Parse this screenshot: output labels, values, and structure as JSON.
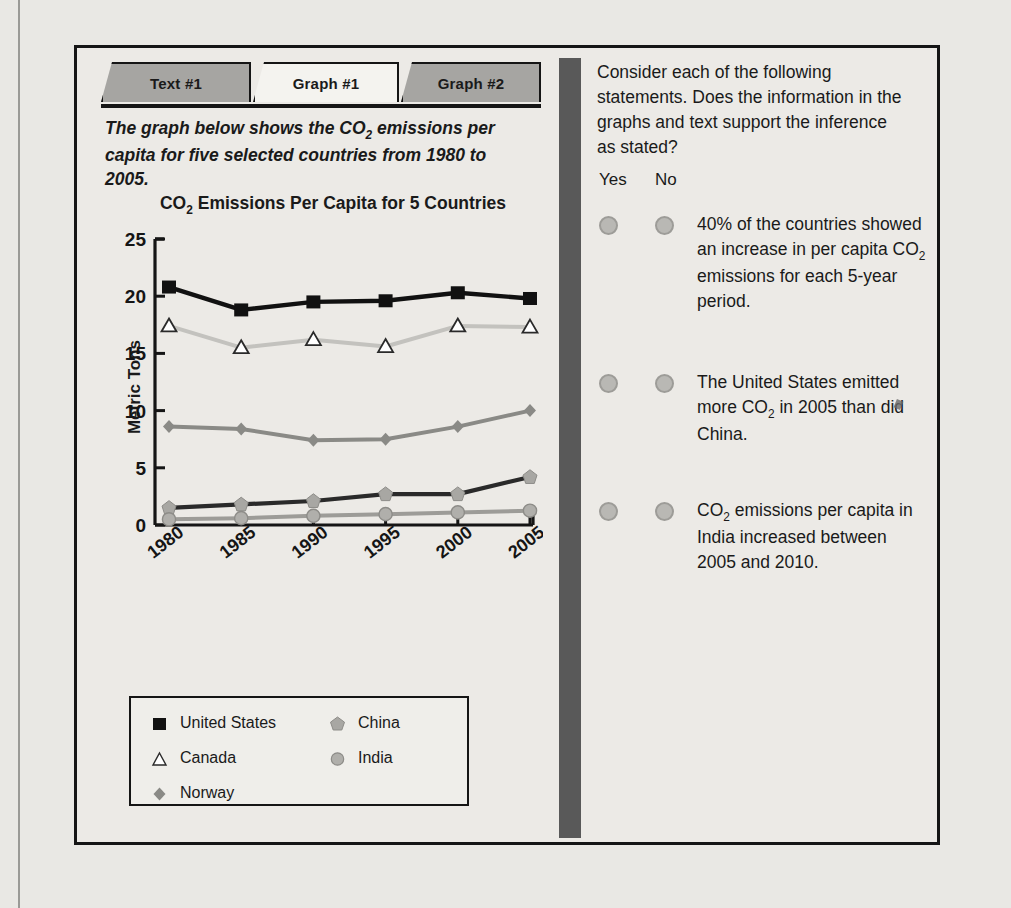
{
  "tabs": [
    {
      "label": "Text #1",
      "active": false
    },
    {
      "label": "Graph #1",
      "active": true
    },
    {
      "label": "Graph #2",
      "active": false
    }
  ],
  "prompt": {
    "line1_a": "The graph below shows the CO",
    "line1_sub": "2",
    "line1_b": " emissions per",
    "line2": "capita for five selected countries from 1980 to 2005."
  },
  "question": {
    "text": "Consider each of the following statements. Does the information in the graphs and text support the inference as stated?",
    "yes_label": "Yes",
    "no_label": "No"
  },
  "statements": [
    {
      "parts": [
        "40% of the countries showed an increase in per capita CO",
        "2",
        " emissions for each 5-year period."
      ],
      "yes_selected": false,
      "no_selected": false
    },
    {
      "parts": [
        "The United States emitted more CO",
        "2",
        " in 2005 than did China."
      ],
      "yes_selected": false,
      "no_selected": false
    },
    {
      "parts": [
        "CO",
        "2",
        " emissions per capita in India increased between 2005 and 2010."
      ],
      "yes_selected": false,
      "no_selected": false
    }
  ],
  "chart_data": {
    "type": "line",
    "title_a": "CO",
    "title_sub": "2",
    "title_b": " Emissions Per Capita for 5 Countries",
    "title": "CO2 Emissions Per Capita for 5 Countries",
    "xlabel": "",
    "ylabel": "Metric Tons",
    "categories": [
      "1980",
      "1985",
      "1990",
      "1995",
      "2000",
      "2005"
    ],
    "yticks": [
      0,
      5,
      10,
      15,
      20,
      25
    ],
    "ylim": [
      0,
      25
    ],
    "grid": false,
    "legend_position": "below-plot",
    "series": [
      {
        "name": "United States",
        "marker": "square",
        "color": "#111111",
        "line_color": "#111111",
        "values": [
          20.8,
          18.8,
          19.5,
          19.6,
          20.3,
          19.8
        ]
      },
      {
        "name": "Canada",
        "marker": "triangle",
        "color": "#ffffff",
        "line_color": "#c3c2be",
        "values": [
          17.4,
          15.5,
          16.2,
          15.6,
          17.4,
          17.3
        ]
      },
      {
        "name": "Norway",
        "marker": "diamond",
        "color": "#8a8a86",
        "line_color": "#8a8a86",
        "values": [
          8.6,
          8.4,
          7.4,
          7.5,
          8.6,
          10.0
        ]
      },
      {
        "name": "China",
        "marker": "pentagon",
        "color": "#a8a7a3",
        "line_color": "#2a2a2a",
        "values": [
          1.5,
          1.8,
          2.1,
          2.7,
          2.7,
          4.2
        ]
      },
      {
        "name": "India",
        "marker": "circle",
        "color": "#b0afab",
        "line_color": "#9d9c98",
        "values": [
          0.5,
          0.6,
          0.8,
          0.95,
          1.1,
          1.25
        ]
      }
    ]
  },
  "legend": [
    {
      "name": "United States",
      "marker": "square"
    },
    {
      "name": "China",
      "marker": "pentagon"
    },
    {
      "name": "Canada",
      "marker": "triangle"
    },
    {
      "name": "India",
      "marker": "circle"
    },
    {
      "name": "Norway",
      "marker": "diamond"
    }
  ],
  "colors": {
    "frame": "#151515",
    "page_bg": "#e9e8e4",
    "panel_bg": "#eceae6",
    "tab_inactive": "#a6a5a2",
    "tab_active": "#f4f3ef",
    "divider": "#595959",
    "radio": "#b9b8b4"
  }
}
